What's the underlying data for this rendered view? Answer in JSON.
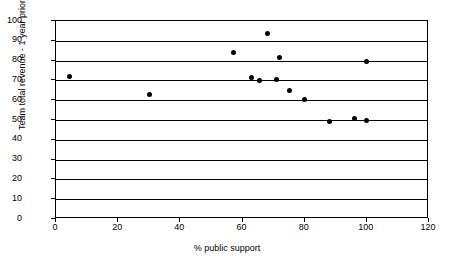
{
  "chart_data": {
    "type": "scatter",
    "title": "",
    "xlabel": "% public support",
    "ylabel": "Team total revenue - 1 year prior",
    "xlim": [
      0,
      120
    ],
    "ylim": [
      0,
      100
    ],
    "xticks": [
      0,
      20,
      40,
      60,
      80,
      100,
      120
    ],
    "yticks": [
      0,
      10,
      20,
      30,
      40,
      50,
      60,
      70,
      80,
      90,
      100
    ],
    "grid": "horizontal",
    "legend": "none",
    "marker": "filled-diamond",
    "marker_color": "#000000",
    "series": [
      {
        "name": "teams",
        "points": [
          {
            "x": 4.5,
            "y": 71.8
          },
          {
            "x": 30.0,
            "y": 62.8
          },
          {
            "x": 57.0,
            "y": 84.2
          },
          {
            "x": 62.8,
            "y": 71.6
          },
          {
            "x": 65.5,
            "y": 69.7
          },
          {
            "x": 68.0,
            "y": 93.5
          },
          {
            "x": 71.0,
            "y": 70.5
          },
          {
            "x": 71.8,
            "y": 81.4
          },
          {
            "x": 75.0,
            "y": 65.0
          },
          {
            "x": 80.0,
            "y": 60.6
          },
          {
            "x": 88.0,
            "y": 49.3
          },
          {
            "x": 96.0,
            "y": 50.9
          },
          {
            "x": 100.0,
            "y": 49.5
          },
          {
            "x": 100.0,
            "y": 79.7
          }
        ]
      }
    ]
  }
}
